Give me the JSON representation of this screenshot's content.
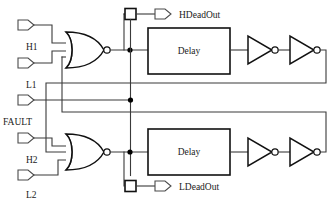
{
  "diagram": {
    "type": "logic-circuit-schematic",
    "colors": {
      "wire": "#3a3a3a",
      "gate_outline": "#111111",
      "background": "#ffffff",
      "junction": "#000000"
    }
  },
  "inputs": [
    {
      "id": "h1",
      "label": "H1",
      "x": 30,
      "y": 25,
      "label_x": 26,
      "label_y": 49
    },
    {
      "id": "l1",
      "label": "L1",
      "x": 30,
      "y": 63,
      "label_x": 26,
      "label_y": 87
    },
    {
      "id": "fault",
      "label": "FAULT",
      "x": 30,
      "y": 101,
      "label_x": 3,
      "label_y": 125
    },
    {
      "id": "h2",
      "label": "H2",
      "x": 30,
      "y": 138,
      "label_x": 26,
      "label_y": 162
    },
    {
      "id": "l2",
      "label": "L2",
      "x": 30,
      "y": 175,
      "label_x": 26,
      "label_y": 197
    }
  ],
  "outputs": [
    {
      "id": "hdeadout",
      "label": "HDeadOut",
      "x": 160,
      "y": 14,
      "label_x": 183,
      "label_y": 18
    },
    {
      "id": "ldeadout",
      "label": "LDeadOut",
      "x": 160,
      "y": 186,
      "label_x": 183,
      "label_y": 190
    }
  ],
  "blocks": [
    {
      "id": "delay-top",
      "label": "Delay",
      "x": 148,
      "y": 29,
      "w": 82,
      "h": 46
    },
    {
      "id": "delay-bottom",
      "label": "Delay",
      "x": 148,
      "y": 130,
      "w": 82,
      "h": 46
    }
  ],
  "gates": [
    {
      "id": "nor-top",
      "type": "NOR",
      "inputs": 3,
      "x": 68,
      "y": 50
    },
    {
      "id": "nor-bottom",
      "type": "NOR",
      "inputs": 3,
      "x": 68,
      "y": 152
    },
    {
      "id": "inv-top-1",
      "type": "NOT",
      "x": 248,
      "y": 50
    },
    {
      "id": "inv-top-2",
      "type": "NOT",
      "x": 290,
      "y": 50
    },
    {
      "id": "inv-bottom-1",
      "type": "NOT",
      "x": 248,
      "y": 152
    },
    {
      "id": "inv-bottom-2",
      "type": "NOT",
      "x": 290,
      "y": 152
    }
  ],
  "test_points": [
    {
      "id": "tp-top",
      "x": 130,
      "y": 14
    },
    {
      "id": "tp-bottom",
      "x": 130,
      "y": 186
    }
  ],
  "junctions": [
    {
      "id": "node-top-nor-out",
      "x": 130,
      "y": 50
    },
    {
      "id": "node-fault-branch",
      "x": 130,
      "y": 100
    },
    {
      "id": "node-bottom-nor-out",
      "x": 130,
      "y": 152
    }
  ],
  "nets": [
    {
      "id": "h1-to-nor-top",
      "from": "H1",
      "to": "nor-top.in1"
    },
    {
      "id": "l1-to-nor-top",
      "from": "L1",
      "to": "nor-top.in2"
    },
    {
      "id": "fault-to-node",
      "from": "FAULT",
      "to": "node-fault-branch"
    },
    {
      "id": "h2-to-nor-bottom",
      "from": "H2",
      "to": "nor-bottom.in1"
    },
    {
      "id": "l2-to-nor-bottom",
      "from": "L2",
      "to": "nor-bottom.in2"
    },
    {
      "id": "nortop-out-to-delay",
      "from": "nor-top.out",
      "to": "delay-top.in"
    },
    {
      "id": "nortop-out-to-tp",
      "from": "node-top-nor-out",
      "to": "tp-top"
    },
    {
      "id": "norbot-out-to-delay",
      "from": "nor-bottom.out",
      "to": "delay-bottom.in"
    },
    {
      "id": "norbot-out-to-tp",
      "from": "node-bottom-nor-out",
      "to": "tp-bottom"
    },
    {
      "id": "feedback-top",
      "from": "inv-top-2.out",
      "to": "nor-bottom.in3"
    },
    {
      "id": "feedback-bottom",
      "from": "inv-bottom-2.out",
      "to": "nor-top.in3"
    }
  ]
}
